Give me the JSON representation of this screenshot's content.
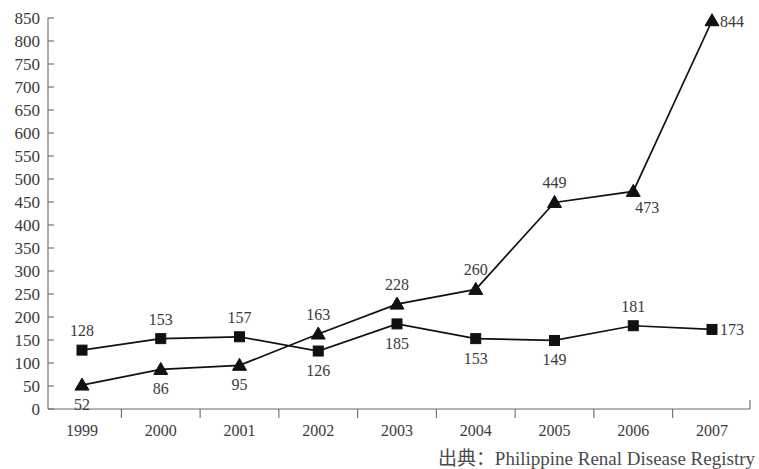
{
  "chart_data": {
    "type": "line",
    "title": "",
    "xlabel": "",
    "ylabel": "",
    "categories": [
      "1999",
      "2000",
      "2001",
      "2002",
      "2003",
      "2004",
      "2005",
      "2006",
      "2007"
    ],
    "series": [
      {
        "name": "square-series",
        "marker": "square",
        "values": [
          128,
          153,
          157,
          126,
          185,
          153,
          149,
          181,
          173
        ],
        "label_positions": [
          "above",
          "above",
          "above",
          "below",
          "below",
          "below",
          "below",
          "above",
          "right"
        ]
      },
      {
        "name": "triangle-series",
        "marker": "triangle",
        "values": [
          52,
          86,
          95,
          163,
          228,
          260,
          449,
          473,
          844
        ],
        "label_positions": [
          "below",
          "below",
          "below",
          "above",
          "above",
          "above",
          "above",
          "below-right",
          "right"
        ]
      }
    ],
    "ylim": [
      0,
      850
    ],
    "ytick_step": 50,
    "yticks": [
      0,
      50,
      100,
      150,
      200,
      250,
      300,
      350,
      400,
      450,
      500,
      550,
      600,
      650,
      700,
      750,
      800,
      850
    ],
    "grid": false,
    "legend": "none",
    "line_color": "#111111",
    "axis_color": "#6b6b6b"
  },
  "footer": {
    "source_note": "出典：Philippine Renal Disease Registry"
  }
}
